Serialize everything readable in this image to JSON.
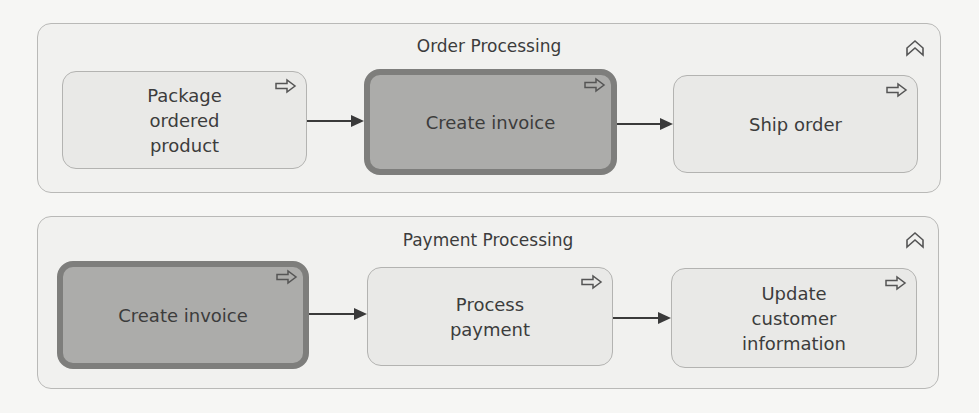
{
  "colors": {
    "background": "#f6f6f4",
    "group_fill": "#f1f1ef",
    "group_border": "#b9b9b7",
    "activity_fill": "#e9e9e7",
    "activity_border": "#b3b3b1",
    "selected_fill": "#acacaa",
    "selected_border": "#7e7e7c",
    "connector": "#3a3a3a",
    "text": "#3c3c3c"
  },
  "groups": [
    {
      "title": "Order Processing",
      "collapse_icon": "double-chevron-up-icon",
      "activities": [
        {
          "label": "Package\nordered\nproduct",
          "selected": false,
          "icon": "flow-arrow-icon"
        },
        {
          "label": "Create invoice",
          "selected": true,
          "icon": "flow-arrow-icon"
        },
        {
          "label": "Ship order",
          "selected": false,
          "icon": "flow-arrow-icon"
        }
      ],
      "connectors": [
        {
          "from": "Package ordered product",
          "to": "Create invoice"
        },
        {
          "from": "Create invoice",
          "to": "Ship order"
        }
      ]
    },
    {
      "title": "Payment Processing",
      "collapse_icon": "double-chevron-up-icon",
      "activities": [
        {
          "label": "Create invoice",
          "selected": true,
          "icon": "flow-arrow-icon"
        },
        {
          "label": "Process\npayment",
          "selected": false,
          "icon": "flow-arrow-icon"
        },
        {
          "label": "Update\ncustomer\ninformation",
          "selected": false,
          "icon": "flow-arrow-icon"
        }
      ],
      "connectors": [
        {
          "from": "Create invoice",
          "to": "Process payment"
        },
        {
          "from": "Process payment",
          "to": "Update customer information"
        }
      ]
    }
  ]
}
